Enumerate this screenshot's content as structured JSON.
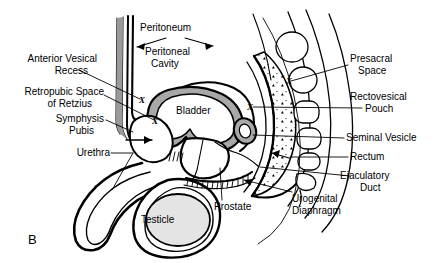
{
  "figure": {
    "panel_letter": "B",
    "caption_type": "sagittal-section-male-pelvis"
  },
  "colors": {
    "ink": "#000000",
    "background": "#ffffff",
    "bladder_wall_fill": "#a8a8a8",
    "organ_fill": "#e4e4e4",
    "muscle_fill": "#9a9a9a",
    "stipple_fill": "#ffffff"
  },
  "labels": {
    "left": [
      {
        "id": "anterior-vesical-recess",
        "lines": [
          "Anterior Vesical",
          "Recess"
        ]
      },
      {
        "id": "retropubic-space-of-retzius",
        "lines": [
          "Retropubic Space",
          "of Retzius"
        ]
      },
      {
        "id": "symphysis-pubis",
        "lines": [
          "Symphysis",
          "Pubis"
        ]
      },
      {
        "id": "urethra",
        "lines": [
          "Urethra"
        ]
      }
    ],
    "top": [
      {
        "id": "peritoneum",
        "lines": [
          "Peritoneum"
        ]
      },
      {
        "id": "peritoneal-cavity",
        "lines": [
          "Peritoneal",
          "Cavity"
        ]
      }
    ],
    "right": [
      {
        "id": "presacral-space",
        "lines": [
          "Presacral",
          "Space"
        ]
      },
      {
        "id": "rectovesical-pouch",
        "lines": [
          "Rectovesical",
          "Pouch"
        ]
      },
      {
        "id": "seminal-vesicle",
        "lines": [
          "Seminal Vesicle"
        ]
      },
      {
        "id": "rectum",
        "lines": [
          "Rectum"
        ]
      },
      {
        "id": "ejaculatory-duct",
        "lines": [
          "Ejaculatory",
          "Duct"
        ]
      }
    ],
    "bottom": [
      {
        "id": "prostate",
        "lines": [
          "Prostate"
        ]
      },
      {
        "id": "urogenital-diaphragm",
        "lines": [
          "Urogenital",
          "Diaphragm"
        ]
      }
    ],
    "inline": [
      {
        "id": "bladder",
        "lines": [
          "Bladder"
        ]
      },
      {
        "id": "testicle",
        "lines": [
          "Testicle"
        ]
      }
    ]
  },
  "text": {
    "panel_letter": "B",
    "peritoneum": "Peritoneum",
    "peritoneal_cavity_1": "Peritoneal",
    "peritoneal_cavity_2": "Cavity",
    "anterior_vesical_1": "Anterior Vesical",
    "anterior_vesical_2": "Recess",
    "retropubic_1": "Retropubic Space",
    "retropubic_2": "of Retzius",
    "symphysis_1": "Symphysis",
    "symphysis_2": "Pubis",
    "urethra": "Urethra",
    "bladder": "Bladder",
    "testicle": "Testicle",
    "presacral_1": "Presacral",
    "presacral_2": "Space",
    "rectovesical_1": "Rectovesical",
    "rectovesical_2": "Pouch",
    "seminal_vesicle": "Seminal Vesicle",
    "rectum": "Rectum",
    "ejaculatory_1": "Ejaculatory",
    "ejaculatory_2": "Duct",
    "prostate": "Prostate",
    "urogenital_1": "Urogenital",
    "urogenital_2": "Diaphragm",
    "x_marker": "X"
  },
  "x_markers": [
    {
      "id": "x-retropubic-upper",
      "label": "X"
    },
    {
      "id": "x-retropubic-lower",
      "label": "X"
    },
    {
      "id": "x-rectovesical",
      "label": "X"
    },
    {
      "id": "x-presacral",
      "label": "X"
    }
  ]
}
